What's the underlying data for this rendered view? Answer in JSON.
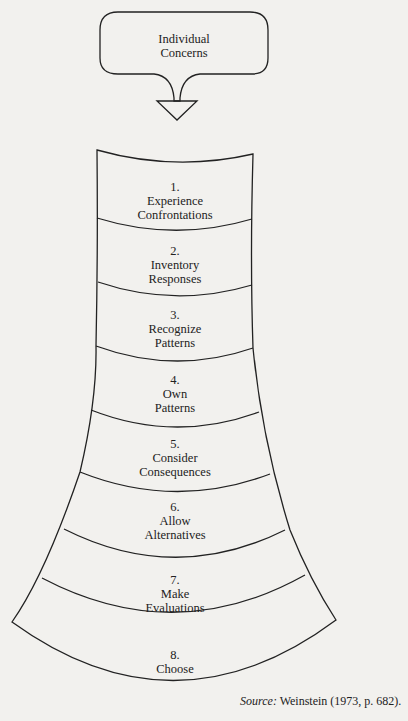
{
  "bubble": {
    "line1": "Individual",
    "line2": "Concerns"
  },
  "steps": [
    {
      "num": "1.",
      "line1": "Experience",
      "line2": "Confrontations"
    },
    {
      "num": "2.",
      "line1": "Inventory",
      "line2": "Responses"
    },
    {
      "num": "3.",
      "line1": "Recognize",
      "line2": "Patterns"
    },
    {
      "num": "4.",
      "line1": "Own",
      "line2": "Patterns"
    },
    {
      "num": "5.",
      "line1": "Consider",
      "line2": "Consequences"
    },
    {
      "num": "6.",
      "line1": "Allow",
      "line2": "Alternatives"
    },
    {
      "num": "7.",
      "line1": "Make",
      "line2": "Evaluations"
    },
    {
      "num": "8.",
      "line1": "Choose",
      "line2": ""
    }
  ],
  "source": {
    "label": "Source:",
    "citation": "Weinstein (1973, p. 682)."
  },
  "colors": {
    "line": "#222222",
    "background": "#f2f1ee"
  }
}
